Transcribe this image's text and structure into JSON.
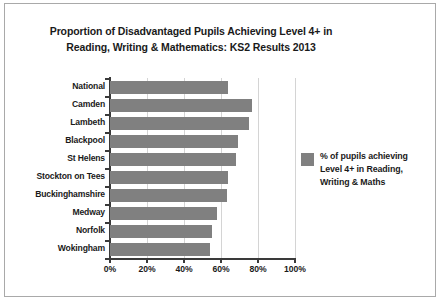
{
  "chart_data": {
    "type": "bar",
    "orientation": "horizontal",
    "title_lines": [
      "Proportion of Disadvantaged Pupils Achieving Level 4+ in",
      "Reading, Writing & Mathematics: KS2 Results 2013"
    ],
    "title": "Proportion of Disadvantaged Pupils Achieving Level 4+ in Reading, Writing & Mathematics: KS2 Results 2013",
    "categories": [
      "National",
      "Camden",
      "Lambeth",
      "Blackpool",
      "St Helens",
      "Stockton on Tees",
      "Buckinghamshire",
      "Medway",
      "Norfolk",
      "Wokingham"
    ],
    "values": [
      64,
      77,
      75,
      69,
      68,
      64,
      63,
      58,
      55,
      54
    ],
    "series": [
      {
        "name": "% of pupils achieving Level 4+ in Reading, Writing & Maths",
        "values": [
          64,
          77,
          75,
          69,
          68,
          64,
          63,
          58,
          55,
          54
        ],
        "color": "#808080"
      }
    ],
    "xlabel": "",
    "ylabel": "",
    "xlim": [
      0,
      100
    ],
    "xticks": [
      0,
      20,
      40,
      60,
      80,
      100
    ],
    "xtick_labels": [
      "0%",
      "20%",
      "40%",
      "60%",
      "80%",
      "100%"
    ],
    "grid": "vertical",
    "legend_position": "right",
    "legend_lines": [
      "% of pupils achieving",
      "Level 4+ in Reading,",
      "Writing & Maths"
    ],
    "bar_color": "#808080",
    "gridline_color": "#d4d4d4",
    "axis_color": "#3a3a3a",
    "background_color": "#ffffff",
    "border_color": "#a9a9a9"
  }
}
